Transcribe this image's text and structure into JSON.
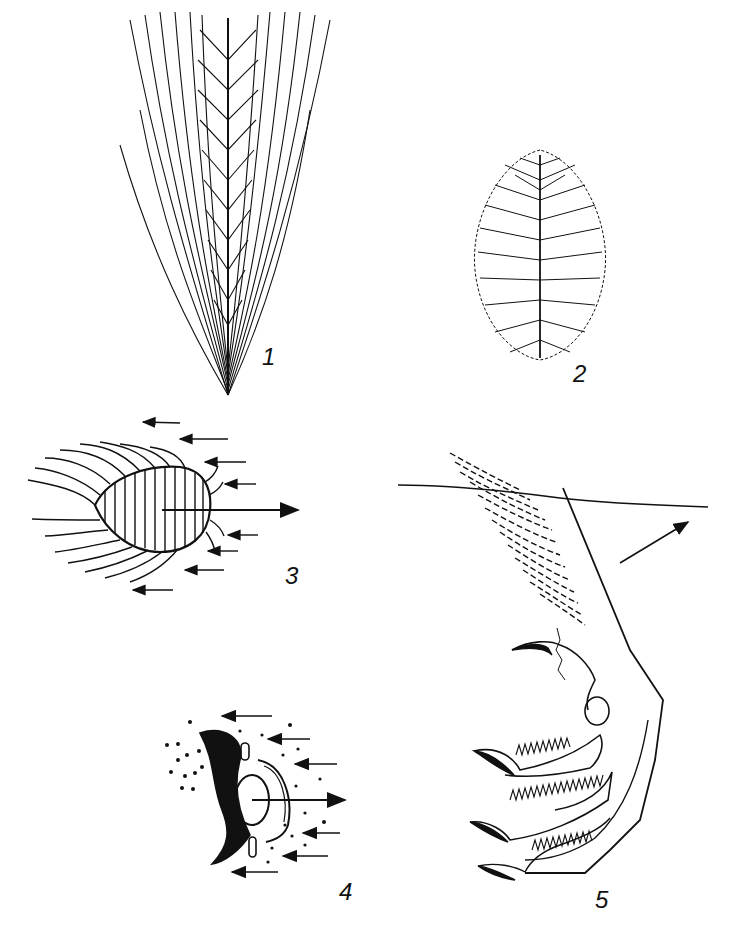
{
  "figure": {
    "panels": [
      {
        "id": "1",
        "label": "1",
        "subject": "contour-feather"
      },
      {
        "id": "2",
        "label": "2",
        "subject": "down-feather"
      },
      {
        "id": "3",
        "label": "3",
        "subject": "feathered-body-in-airflow"
      },
      {
        "id": "4",
        "label": "4",
        "subject": "eye-in-particle-flow"
      },
      {
        "id": "5",
        "label": "5",
        "subject": "fringed-toes-below-water-surface"
      }
    ],
    "colors": {
      "ink": "#111111",
      "background": "#ffffff"
    }
  }
}
